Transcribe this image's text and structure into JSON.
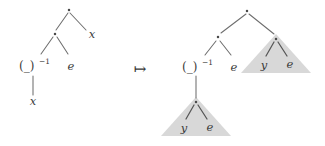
{
  "figure": {
    "kind": "term-rewriting-diagram",
    "relation_symbol": "↦",
    "relation_name": "maps-to-arrow",
    "background_color": "#ffffff",
    "triangle_fill_color": "#d8d8d8",
    "edge_color": "#6e6e6e",
    "node_color": "#4a4a4a",
    "text_color": "#3a3a3a"
  },
  "left_tree": {
    "name": "source-term-tree",
    "root": {
      "label": "·",
      "name": "multiplication-dot"
    },
    "root_right_child": {
      "label": "x",
      "name": "variable-x"
    },
    "inner_node": {
      "label": "·",
      "name": "multiplication-dot"
    },
    "inverse_node": {
      "base": "(_)",
      "exponent": "−1",
      "name": "inverse-operator"
    },
    "unit_node": {
      "label": "e",
      "name": "unit-element-e"
    },
    "inverse_child": {
      "label": "x",
      "name": "variable-x"
    }
  },
  "right_tree": {
    "name": "target-term-tree",
    "root": {
      "label": "·",
      "name": "multiplication-dot"
    },
    "inner_node": {
      "label": "·",
      "name": "multiplication-dot"
    },
    "inverse_node": {
      "base": "(_)",
      "exponent": "−1",
      "name": "inverse-operator"
    },
    "unit_node": {
      "label": "e",
      "name": "unit-element-e"
    },
    "triangles": [
      {
        "name": "upper-right-subtree-triangle",
        "apex": {
          "label": "·",
          "name": "multiplication-dot"
        },
        "left_leaf": {
          "label": "y",
          "name": "variable-y"
        },
        "right_leaf": {
          "label": "e",
          "name": "unit-element-e"
        }
      },
      {
        "name": "lower-left-subtree-triangle",
        "apex": {
          "label": "·",
          "name": "multiplication-dot"
        },
        "left_leaf": {
          "label": "y",
          "name": "variable-y"
        },
        "right_leaf": {
          "label": "e",
          "name": "unit-element-e"
        }
      }
    ]
  }
}
